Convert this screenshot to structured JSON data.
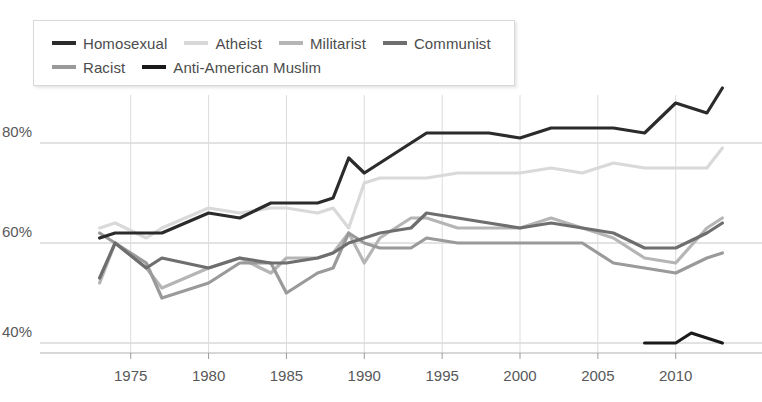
{
  "chart_data": {
    "type": "line",
    "title": "",
    "subtitle": "",
    "xlabel": "",
    "ylabel": "",
    "xlim": [
      1972,
      2014
    ],
    "ylim": [
      33,
      90
    ],
    "grid": true,
    "legend_position": "top-left",
    "yticks": [
      40,
      60,
      80
    ],
    "ytick_labels": [
      "40%",
      "60%",
      "80%"
    ],
    "xticks": [
      1975,
      1980,
      1985,
      1990,
      1995,
      2000,
      2005,
      2010
    ],
    "xtick_labels": [
      "1975",
      "1980",
      "1985",
      "1990",
      "1995",
      "2000",
      "2005",
      "2010"
    ],
    "series": [
      {
        "name": "Homosexual",
        "color": "#2b2b2b",
        "width": 3.2,
        "x": [
          1973,
          1974,
          1976,
          1977,
          1980,
          1982,
          1984,
          1985,
          1987,
          1988,
          1989,
          1990,
          1991,
          1993,
          1994,
          1996,
          1998,
          2000,
          2002,
          2004,
          2006,
          2008,
          2010,
          2012,
          2013
        ],
        "y": [
          61,
          62,
          62,
          62,
          66,
          65,
          68,
          68,
          68,
          69,
          77,
          74,
          76,
          80,
          82,
          82,
          82,
          81,
          83,
          83,
          83,
          82,
          88,
          86,
          91
        ]
      },
      {
        "name": "Atheist",
        "color": "#d9d9d9",
        "width": 3.2,
        "x": [
          1973,
          1974,
          1976,
          1977,
          1980,
          1982,
          1984,
          1985,
          1987,
          1988,
          1989,
          1990,
          1991,
          1993,
          1994,
          1996,
          1998,
          2000,
          2002,
          2004,
          2006,
          2008,
          2010,
          2012,
          2013
        ],
        "y": [
          63,
          64,
          61,
          63,
          67,
          66,
          67,
          67,
          66,
          67,
          63,
          72,
          73,
          73,
          73,
          74,
          74,
          74,
          75,
          74,
          76,
          75,
          75,
          75,
          79
        ]
      },
      {
        "name": "Militarist",
        "color": "#b5b5b5",
        "width": 3.2,
        "x": [
          1973,
          1974,
          1976,
          1977,
          1980,
          1982,
          1984,
          1985,
          1987,
          1988,
          1989,
          1990,
          1991,
          1993,
          1994,
          1996,
          1998,
          2000,
          2002,
          2004,
          2006,
          2008,
          2010,
          2012,
          2013
        ],
        "y": [
          52,
          60,
          55,
          51,
          55,
          57,
          54,
          57,
          57,
          58,
          62,
          56,
          61,
          65,
          65,
          63,
          63,
          63,
          65,
          63,
          61,
          57,
          56,
          63,
          65
        ]
      },
      {
        "name": "Communist",
        "color": "#6e6e6e",
        "width": 3.2,
        "x": [
          1973,
          1974,
          1976,
          1977,
          1980,
          1982,
          1984,
          1985,
          1987,
          1988,
          1989,
          1990,
          1991,
          1993,
          1994,
          1996,
          1998,
          2000,
          2002,
          2004,
          2006,
          2008,
          2010,
          2012,
          2013
        ],
        "y": [
          53,
          60,
          55,
          57,
          55,
          57,
          56,
          56,
          57,
          58,
          60,
          61,
          62,
          63,
          66,
          65,
          64,
          63,
          64,
          63,
          62,
          59,
          59,
          62,
          64
        ]
      },
      {
        "name": "Racist",
        "color": "#9a9a9a",
        "width": 3.2,
        "x": [
          1973,
          1974,
          1976,
          1977,
          1980,
          1982,
          1984,
          1985,
          1987,
          1988,
          1989,
          1990,
          1991,
          1993,
          1994,
          1996,
          1998,
          2000,
          2002,
          2004,
          2006,
          2008,
          2010,
          2012,
          2013
        ],
        "y": [
          62,
          60,
          56,
          49,
          52,
          56,
          56,
          50,
          54,
          55,
          62,
          60,
          59,
          59,
          61,
          60,
          60,
          60,
          60,
          60,
          56,
          55,
          54,
          57,
          58
        ]
      },
      {
        "name": "Anti-American Muslim",
        "color": "#1a1a1a",
        "width": 3.2,
        "x": [
          2008,
          2010,
          2011,
          2012,
          2013
        ],
        "y": [
          40,
          40,
          42,
          41,
          40
        ]
      }
    ]
  },
  "legend": {
    "rows": [
      [
        {
          "label": "Homosexual",
          "color": "#2b2b2b"
        },
        {
          "label": "Atheist",
          "color": "#d9d9d9"
        },
        {
          "label": "Militarist",
          "color": "#b5b5b5"
        },
        {
          "label": "Communist",
          "color": "#6e6e6e"
        }
      ],
      [
        {
          "label": "Racist",
          "color": "#9a9a9a"
        },
        {
          "label": "Anti-American Muslim",
          "color": "#1a1a1a"
        }
      ]
    ]
  },
  "colors": {
    "background": "#ffffff",
    "gridline": "#c6c6c6",
    "axis_text": "#58585a",
    "legend_border": "#d8d8d8"
  }
}
